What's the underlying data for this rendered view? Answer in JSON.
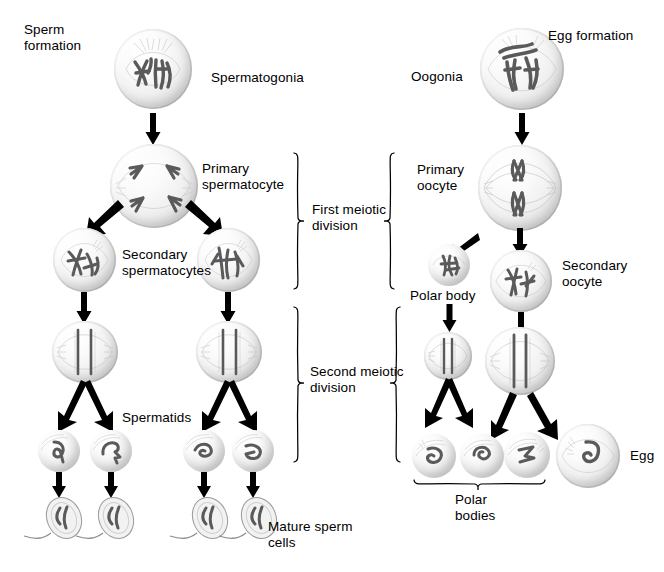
{
  "figure": {
    "type": "diagram",
    "background_color": "#ffffff",
    "text_color": "#000000"
  },
  "labels": {
    "sperm_formation": "Sperm\nformation",
    "spermatogonia": "Spermatogonia",
    "primary_spermatocyte": "Primary\nspermatocyte",
    "secondary_spermatocytes": "Secondary\nspermatocytes",
    "spermatids": "Spermatids",
    "mature_sperm_cells": "Mature sperm\ncells",
    "egg_formation": "Egg formation",
    "oogonia": "Oogonia",
    "primary_oocyte": "Primary\noocyte",
    "secondary_oocyte": "Secondary\noocyte",
    "polar_body": "Polar body",
    "polar_bodies": "Polar\nbodies",
    "egg": "Egg",
    "first_meiotic_division": "First meiotic\ndivision",
    "second_meiotic_division": "Second meiotic\ndivision"
  },
  "columns": {
    "left": {
      "name": "spermatogenesis",
      "stages": [
        {
          "key": "spermatogonia",
          "label": "Spermatogonia",
          "count": 1,
          "ploidy": "diploid"
        },
        {
          "key": "primary-spermatocyte",
          "label": "Primary spermatocyte",
          "count": 1,
          "ploidy": "diploid"
        },
        {
          "key": "secondary-spermatocytes",
          "label": "Secondary spermatocytes",
          "count": 2,
          "ploidy": "haploid"
        },
        {
          "key": "metaphase-cells",
          "label": "Second division cells",
          "count": 2,
          "ploidy": "haploid"
        },
        {
          "key": "spermatids",
          "label": "Spermatids",
          "count": 4,
          "ploidy": "haploid"
        },
        {
          "key": "mature-sperm",
          "label": "Mature sperm cells",
          "count": 4,
          "ploidy": "haploid"
        }
      ]
    },
    "right": {
      "name": "oogenesis",
      "stages": [
        {
          "key": "oogonia",
          "label": "Oogonia",
          "count": 1,
          "ploidy": "diploid"
        },
        {
          "key": "primary-oocyte",
          "label": "Primary oocyte",
          "count": 1,
          "ploidy": "diploid"
        },
        {
          "key": "first-polar-body",
          "label": "Polar body",
          "count": 1,
          "ploidy": "haploid"
        },
        {
          "key": "secondary-oocyte",
          "label": "Secondary oocyte",
          "count": 1,
          "ploidy": "haploid"
        },
        {
          "key": "second-division-cells",
          "label": "Second division cells",
          "count": 2,
          "ploidy": "haploid"
        },
        {
          "key": "polar-bodies",
          "label": "Polar bodies",
          "count": 3,
          "ploidy": "haploid"
        },
        {
          "key": "egg",
          "label": "Egg",
          "count": 1,
          "ploidy": "haploid"
        }
      ]
    }
  },
  "brackets": [
    {
      "key": "first-meiotic-division",
      "label": "First meiotic\ndivision",
      "sides": [
        "left-column",
        "right-column"
      ]
    },
    {
      "key": "second-meiotic-division",
      "label": "Second meiotic\ndivision",
      "sides": [
        "left-column",
        "right-column"
      ]
    },
    {
      "key": "polar-bodies",
      "label": "Polar\nbodies",
      "sides": [
        "under-row"
      ]
    }
  ]
}
